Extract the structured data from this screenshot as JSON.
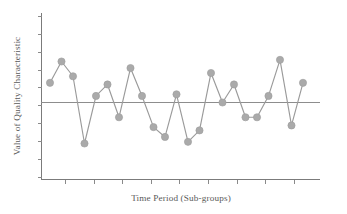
{
  "chart_data": {
    "type": "line",
    "title": "",
    "subtitle": "",
    "xlabel": "Time Period (Sub-groups)",
    "ylabel": "Value of Quality Characteristic",
    "grid": false,
    "legend": false,
    "legend_position": "none",
    "x_tick_labels": [
      "",
      "",
      "",
      "",
      "",
      "",
      "",
      "",
      ""
    ],
    "y_tick_labels": [
      "",
      "",
      "",
      "",
      "",
      "",
      "",
      "",
      "",
      ""
    ],
    "xlim": [
      0,
      24
    ],
    "ylim": [
      -4,
      4
    ],
    "center_line": 0,
    "center_line_label": "",
    "annotations": [],
    "x": [
      1,
      2,
      3,
      4,
      5,
      6,
      7,
      8,
      9,
      10,
      11,
      12,
      13,
      14,
      15,
      16,
      17,
      18,
      19,
      20,
      21,
      22,
      23
    ],
    "series": [
      {
        "name": "Quality Characteristic",
        "color": "#aaaaaa",
        "marker": "circle",
        "values": [
          1.2,
          2.5,
          1.6,
          -2.5,
          0.4,
          1.1,
          -0.9,
          2.1,
          0.4,
          -1.5,
          -2.1,
          0.5,
          -2.4,
          -1.7,
          1.8,
          0.0,
          1.1,
          -0.9,
          -0.9,
          0.4,
          2.6,
          -1.4,
          1.2
        ]
      }
    ]
  },
  "colors": {
    "marker": "#aaaaaa",
    "line": "#9a9a9a",
    "axis": "#7b7b7b",
    "center_line": "#8d8d8d",
    "text": "#5a5a5a",
    "background": "#ffffff"
  }
}
